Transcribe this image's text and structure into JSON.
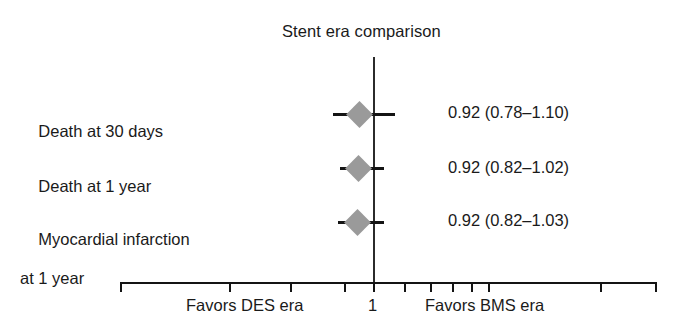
{
  "chart_data": {
    "type": "forest",
    "title": "Stent era comparison",
    "xlabel": "",
    "ylabel": "",
    "scale": "log",
    "reference_line": 1,
    "grid": false,
    "legend": "none",
    "categories": [
      "Death at 30 days",
      "Death at 1 year",
      "Myocardial infarction at 1 year"
    ],
    "rows": [
      {
        "label_line1": "Death at 30 days",
        "label_line2": "",
        "estimate": 0.92,
        "ci_low": 0.78,
        "ci_high": 1.1,
        "estimate_text": "0.92 (0.78–1.10)"
      },
      {
        "label_line1": "Death at 1 year",
        "label_line2": "",
        "estimate": 0.92,
        "ci_low": 0.82,
        "ci_high": 1.02,
        "estimate_text": "0.92 (0.82–1.02)"
      },
      {
        "label_line1": "Myocardial infarction",
        "label_line2": "at 1 year",
        "estimate": 0.92,
        "ci_low": 0.82,
        "ci_high": 1.03,
        "estimate_text": "0.92 (0.82–1.03)"
      }
    ],
    "axis": {
      "tick_label": "1",
      "tick_positions_px": [
        120,
        229,
        290,
        344,
        373,
        404,
        430,
        452,
        471,
        488,
        600,
        655
      ],
      "left_caption": "Favors DES era",
      "right_caption": "Favors BMS era"
    },
    "colors": {
      "marker": "#9a9a9a",
      "line": "#141414",
      "text": "#1a1a1a",
      "background": "#ffffff"
    }
  }
}
